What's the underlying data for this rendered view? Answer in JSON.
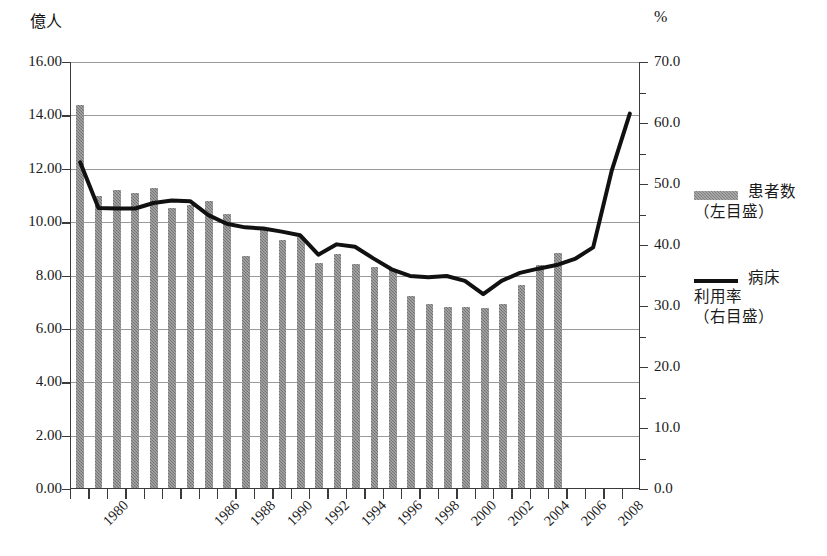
{
  "chart_data": {
    "type": "bar",
    "title": "",
    "subtitle": "",
    "xlabel": "",
    "ylabel_left": "億人",
    "ylabel_right": "%",
    "grid": true,
    "legend_position": "right",
    "x": [
      1980,
      1981,
      1982,
      1983,
      1984,
      1985,
      1986,
      1987,
      1988,
      1989,
      1990,
      1991,
      1992,
      1993,
      1994,
      1995,
      1996,
      1997,
      1998,
      1999,
      2000,
      2001,
      2002,
      2003,
      2004,
      2005,
      2006,
      2007,
      2008,
      2009
    ],
    "x_tick_labels": [
      "1980",
      "",
      "",
      "",
      "",
      "",
      "1986",
      "",
      "1988",
      "",
      "1990",
      "",
      "1992",
      "",
      "1994",
      "",
      "1996",
      "",
      "1998",
      "",
      "2000",
      "",
      "2002",
      "",
      "2004",
      "",
      "2006",
      "",
      "2008",
      ""
    ],
    "left_axis": {
      "min": 0.0,
      "max": 16.0,
      "step": 2.0,
      "ticks": [
        "0.00",
        "2.00",
        "4.00",
        "6.00",
        "8.00",
        "10.00",
        "12.00",
        "14.00",
        "16.00"
      ]
    },
    "right_axis": {
      "min": 0.0,
      "max": 70.0,
      "step": 10.0,
      "ticks": [
        "0.0",
        "10.0",
        "20.0",
        "30.0",
        "40.0",
        "50.0",
        "60.0",
        "70.0"
      ]
    },
    "series": [
      {
        "name": "患者数（左目盛）",
        "short_name": "患者数",
        "axis": "left",
        "kind": "bar",
        "unit": "億人",
        "color": "#808080",
        "values": [
          14.35,
          10.95,
          11.15,
          11.05,
          11.25,
          10.5,
          10.6,
          10.75,
          10.25,
          8.7,
          9.7,
          9.3,
          9.4,
          8.45,
          8.75,
          8.4,
          8.3,
          8.2,
          7.2,
          6.9,
          6.8,
          6.8,
          6.75,
          6.9,
          7.6,
          8.35,
          8.8,
          null,
          null,
          null
        ]
      },
      {
        "name": "病床利用率（右目盛）",
        "short_name": "病床利用率",
        "axis": "right",
        "kind": "line",
        "unit": "%",
        "color": "#111111",
        "values": [
          53.5,
          46.0,
          45.9,
          45.9,
          46.8,
          47.2,
          47.1,
          44.8,
          43.4,
          42.8,
          42.6,
          42.1,
          41.5,
          38.3,
          40.0,
          39.6,
          37.7,
          35.9,
          34.8,
          34.6,
          34.8,
          34.0,
          31.8,
          34.0,
          35.3,
          36.0,
          36.6,
          37.6,
          39.5,
          52.0
        ]
      }
    ],
    "bar_values_full": [
      14.35,
      10.95,
      11.15,
      11.05,
      11.25,
      10.5,
      10.6,
      10.75,
      10.25,
      8.7,
      9.7,
      9.3,
      9.4,
      8.45,
      8.75,
      8.4,
      8.3,
      8.2,
      7.2,
      6.9,
      6.8,
      6.8,
      6.75,
      6.9,
      7.6,
      8.35,
      8.8
    ],
    "line_values_full": [
      53.5,
      46.0,
      45.9,
      45.9,
      46.8,
      47.2,
      47.1,
      44.8,
      43.4,
      42.8,
      42.6,
      42.1,
      41.5,
      38.3,
      40.0,
      39.6,
      37.7,
      35.9,
      34.8,
      34.6,
      34.8,
      34.0,
      31.8,
      34.0,
      35.3,
      36.0,
      36.6,
      37.6,
      39.5,
      52.0,
      61.5
    ]
  },
  "axes": {
    "left_unit": "億人",
    "right_unit": "%"
  },
  "legend": {
    "items": [
      {
        "marker": "bar-swatch",
        "label": "患者数\n（左目盛）"
      },
      {
        "marker": "line-swatch",
        "label": "病床\n利用率\n（右目盛）"
      }
    ]
  }
}
